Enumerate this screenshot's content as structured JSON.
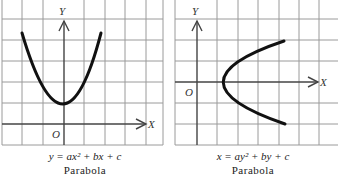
{
  "panels": [
    {
      "equation": "y = ax² + bx + c",
      "name": "Parabola",
      "axis_x_label": "X",
      "axis_y_label": "Y",
      "origin_label": "O",
      "orientation": "vertical, opens upward"
    },
    {
      "equation": "x = ay² + by + c",
      "name": "Parabola",
      "axis_x_label": "X",
      "axis_y_label": "Y",
      "origin_label": "O",
      "orientation": "horizontal, opens rightward"
    }
  ],
  "colors": {
    "grid": "#9a9a9a",
    "axis": "#444444",
    "curve": "#111111",
    "background": "#ffffff"
  }
}
